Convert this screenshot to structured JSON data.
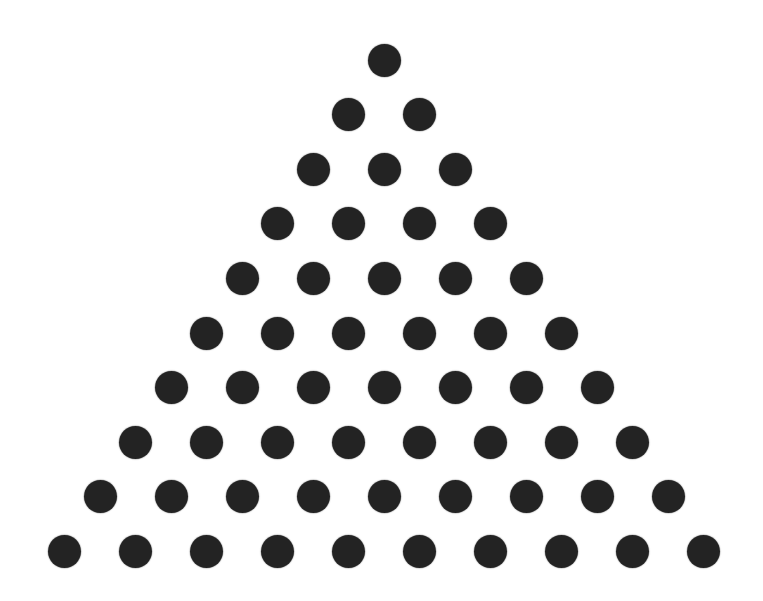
{
  "diagram": {
    "type": "triangular-number-dot-pattern",
    "rows": 10,
    "total_dots": 55,
    "dots_per_row": [
      1,
      2,
      3,
      4,
      5,
      6,
      7,
      8,
      9,
      10
    ],
    "apex_center": [
      384,
      60
    ],
    "row_spacing_px": 54.6,
    "column_spacing_px": 71,
    "dot_diameter_px": 33,
    "dot_color": "#232323",
    "background_color": "#ffffff"
  }
}
